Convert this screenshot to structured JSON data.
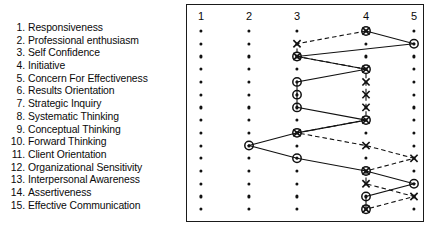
{
  "chart_data": {
    "type": "line",
    "title": "",
    "xlabel": "",
    "ylabel": "",
    "orientation": "horizontal",
    "grid": true,
    "legend_position": "none",
    "x_ticks": [
      "1",
      "2",
      "3",
      "4",
      "5"
    ],
    "xlim": [
      1,
      5
    ],
    "categories": [
      "Responsiveness",
      "Professional enthusiasm",
      "Self Confidence",
      "Initiative",
      "Concern For Effectiveness",
      "Results Orientation",
      "Strategic Inquiry",
      "Systematic Thinking",
      "Conceptual Thinking",
      "Forward Thinking",
      "Client Orientation",
      "Organizational Sensitivity",
      "Interpersonal Awareness",
      "Assertiveness",
      "Effective Communication"
    ],
    "series": [
      {
        "name": "circle-series",
        "marker": "circle",
        "line": "solid",
        "values": [
          4,
          5,
          3,
          4,
          3,
          3,
          3,
          4,
          3,
          2,
          3,
          4,
          5,
          4,
          4
        ]
      },
      {
        "name": "x-series",
        "marker": "x",
        "line": "dashed",
        "values": [
          4,
          3,
          3,
          4,
          4,
          4,
          4,
          4,
          3,
          4,
          5,
          4,
          4,
          5,
          4
        ]
      }
    ],
    "annotations": [
      "Rows where both series coincide render as a circle-with-X overlay marker."
    ]
  },
  "labels": {
    "items": [
      {
        "num": "1.",
        "text": "Responsiveness"
      },
      {
        "num": "2.",
        "text": "Professional enthusiasm"
      },
      {
        "num": "3.",
        "text": "Self Confidence"
      },
      {
        "num": "4.",
        "text": "Initiative"
      },
      {
        "num": "5.",
        "text": "Concern For Effectiveness"
      },
      {
        "num": "6.",
        "text": "Results Orientation"
      },
      {
        "num": "7.",
        "text": "Strategic Inquiry"
      },
      {
        "num": "8.",
        "text": "Systematic Thinking"
      },
      {
        "num": "9.",
        "text": "Conceptual Thinking"
      },
      {
        "num": "10.",
        "text": "Forward Thinking"
      },
      {
        "num": "11.",
        "text": "Client Orientation"
      },
      {
        "num": "12.",
        "text": "Organizational Sensitivity"
      },
      {
        "num": "13.",
        "text": "Interpersonal Awareness"
      },
      {
        "num": "14.",
        "text": "Assertiveness"
      },
      {
        "num": "15.",
        "text": "Effective Communication"
      }
    ]
  },
  "colors": {
    "ink": "#111111",
    "frame": "#1a1a1a",
    "background": "#ffffff"
  }
}
